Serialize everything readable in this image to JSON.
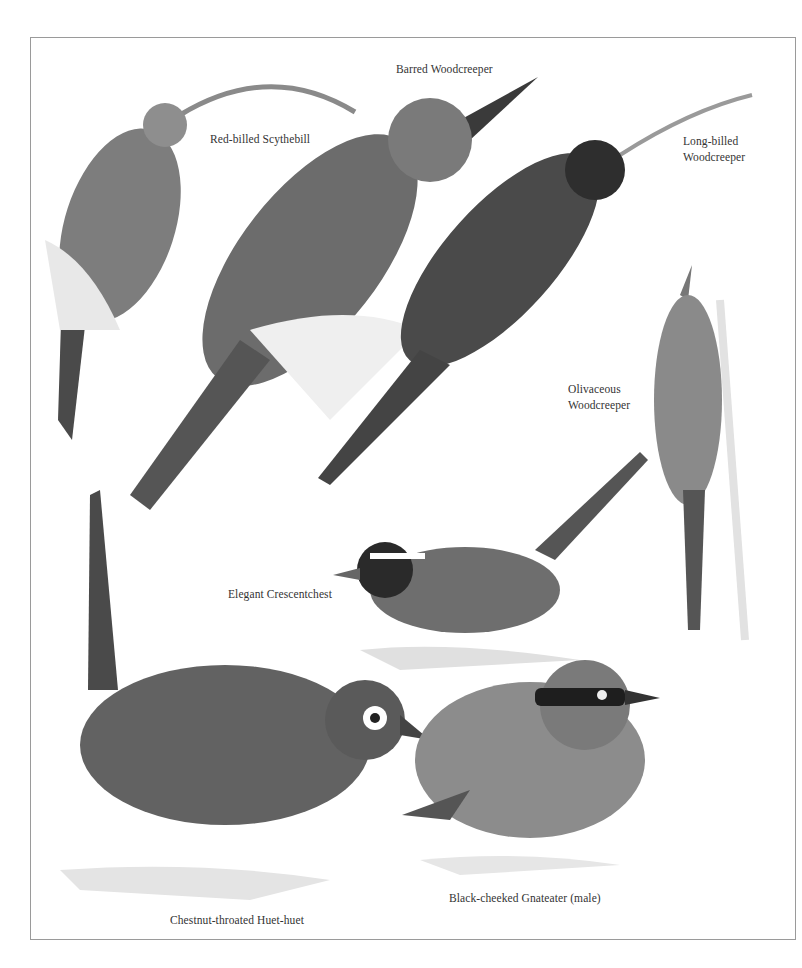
{
  "plate": {
    "border_color": "#9a9a9a",
    "background": "#ffffff"
  },
  "labels": {
    "red_billed_scythebill": "Red-billed Scythebill",
    "barred_woodcreeper": "Barred Woodcreeper",
    "long_billed_woodcreeper_1": "Long-billed",
    "long_billed_woodcreeper_2": "Woodcreeper",
    "olivaceous_woodcreeper_1": "Olivaceous",
    "olivaceous_woodcreeper_2": "Woodcreeper",
    "elegant_crescentchest": "Elegant Crescentchest",
    "chestnut_throated_huet_huet": "Chestnut-throated Huet-huet",
    "black_cheeked_gnateater": "Black-cheeked Gnateater (male)"
  },
  "colors": {
    "bird_dark": "#3e3e3e",
    "bird_mid": "#6a6a6a",
    "bird_light": "#a8a8a8",
    "perch": "#dcdcdc"
  }
}
